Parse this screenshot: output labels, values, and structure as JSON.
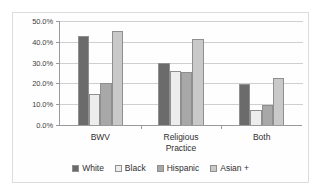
{
  "chart_data": {
    "type": "bar",
    "title": "",
    "subtitle": "",
    "xlabel": "",
    "ylabel": "",
    "categories": [
      "BWV",
      "Religious\nPractice",
      "Both"
    ],
    "series": [
      {
        "name": "White",
        "color": "#6b6b6b",
        "values": [
          43.0,
          30.0,
          19.5
        ]
      },
      {
        "name": "Black",
        "color": "#ededed",
        "values": [
          15.0,
          26.0,
          7.0
        ]
      },
      {
        "name": "Hispanic",
        "color": "#a8a8a8",
        "values": [
          20.0,
          25.5,
          9.5
        ]
      },
      {
        "name": "Asian +",
        "color": "#c9c9c9",
        "values": [
          45.0,
          41.5,
          22.5
        ]
      }
    ],
    "ylim": [
      0,
      50
    ],
    "ytick_values": [
      0,
      10,
      20,
      30,
      40,
      50
    ],
    "ytick_labels": [
      "0.0%",
      "10.0%",
      "20.0%",
      "30.0%",
      "40.0%",
      "50.0%"
    ],
    "grid": true,
    "legend_position": "bottom"
  },
  "legend": {
    "items": [
      {
        "label": "White"
      },
      {
        "label": "Black"
      },
      {
        "label": "Hispanic"
      },
      {
        "label": "Asian +"
      }
    ]
  }
}
